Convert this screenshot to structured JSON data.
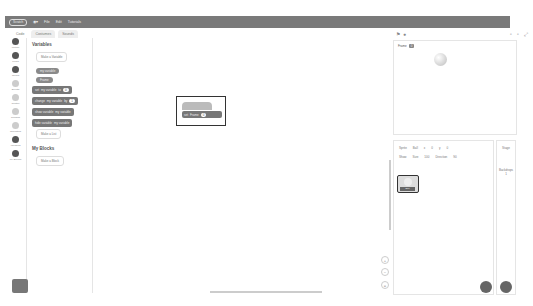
{
  "menu": {
    "logo": "Scratch",
    "items": [
      "File",
      "Edit"
    ],
    "tutorials": "Tutorials"
  },
  "tabs": [
    "Code",
    "Costumes",
    "Sounds"
  ],
  "categories": [
    "Motion",
    "Looks",
    "Sound",
    "Events",
    "Control",
    "Sensing",
    "Operators",
    "Variables",
    "My Blocks"
  ],
  "palette": {
    "variables_title": "Variables",
    "make_variable": "Make a Variable",
    "var_name": "my variable",
    "set": "set",
    "to": "to",
    "change": "change",
    "by": "by",
    "show_var": "show variable",
    "hide_var": "hide variable",
    "val0": "0",
    "val1": "1",
    "make_list": "Make a List",
    "myblocks_title": "My Blocks",
    "make_block": "Make a Block"
  },
  "script": {
    "hat": "when clicked",
    "cmd": "set",
    "var": "Frame",
    "val": "0"
  },
  "stage": {
    "sprite_var": "Frame",
    "sprite_val": "0"
  },
  "sprite_info": {
    "sprite_label": "Sprite",
    "sprite_name": "Ball",
    "x_label": "x",
    "x": "0",
    "y_label": "y",
    "y": "0",
    "show_label": "Show",
    "size_label": "Size",
    "size": "100",
    "direction_label": "Direction",
    "direction": "90"
  },
  "thumb_name": "Ball",
  "stage_pane": {
    "title": "Stage",
    "backdrops": "Backdrops",
    "count": "1"
  },
  "zoom": [
    "+",
    "−",
    "="
  ]
}
